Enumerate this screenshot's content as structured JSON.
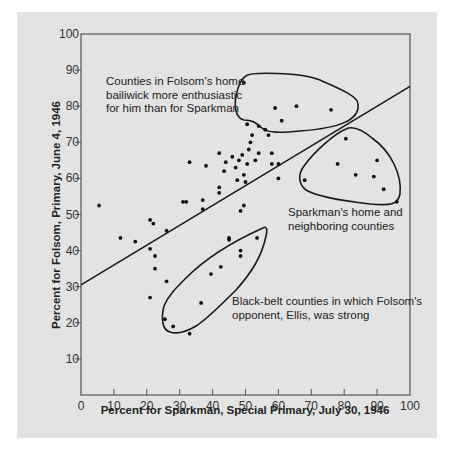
{
  "chart_data": {
    "type": "scatter",
    "title": "",
    "xlabel": "Percent for Sparkman, Special Primary, July 30, 1946",
    "ylabel": "Percent for Folsom, Primary, June 4, 1946",
    "xlim": [
      0,
      100
    ],
    "ylim": [
      0,
      100
    ],
    "xticks": [
      0,
      10,
      20,
      30,
      40,
      50,
      60,
      70,
      80,
      90,
      100
    ],
    "yticks": [
      10,
      20,
      30,
      40,
      50,
      60,
      70,
      80,
      90,
      100
    ],
    "grid": false,
    "regression_line": {
      "x": [
        0,
        100
      ],
      "y": [
        30.5,
        85.5
      ]
    },
    "annotations": [
      {
        "id": "folsom-home",
        "lines": [
          "Counties in Folsom's home",
          "bailiwick more enthusiastic",
          "for him than for Sparkman"
        ]
      },
      {
        "id": "sparkman-home",
        "lines": [
          "Sparkman's home and",
          "neighboring counties"
        ]
      },
      {
        "id": "black-belt",
        "lines": [
          "Black-belt counties in which Folsom's",
          "opponent, Ellis, was strong"
        ]
      }
    ],
    "points": [
      {
        "x": 5.5,
        "y": 52.5
      },
      {
        "x": 12,
        "y": 43.5
      },
      {
        "x": 16.5,
        "y": 42.5
      },
      {
        "x": 21,
        "y": 48.5
      },
      {
        "x": 22,
        "y": 47.5
      },
      {
        "x": 21,
        "y": 40.5
      },
      {
        "x": 22.5,
        "y": 38.5
      },
      {
        "x": 22.5,
        "y": 35
      },
      {
        "x": 26,
        "y": 45.5
      },
      {
        "x": 26,
        "y": 31.5
      },
      {
        "x": 21,
        "y": 27
      },
      {
        "x": 31,
        "y": 53.5
      },
      {
        "x": 32,
        "y": 53.5
      },
      {
        "x": 33,
        "y": 64.5
      },
      {
        "x": 37,
        "y": 54
      },
      {
        "x": 37,
        "y": 51.5
      },
      {
        "x": 38,
        "y": 63.5
      },
      {
        "x": 42,
        "y": 67
      },
      {
        "x": 42,
        "y": 57.5
      },
      {
        "x": 42,
        "y": 56
      },
      {
        "x": 44,
        "y": 64.5
      },
      {
        "x": 43.5,
        "y": 62
      },
      {
        "x": 45,
        "y": 43
      },
      {
        "x": 46,
        "y": 66
      },
      {
        "x": 47,
        "y": 63
      },
      {
        "x": 47.5,
        "y": 59.5
      },
      {
        "x": 48,
        "y": 65
      },
      {
        "x": 48.5,
        "y": 51
      },
      {
        "x": 49,
        "y": 66.5
      },
      {
        "x": 49.5,
        "y": 61
      },
      {
        "x": 49.5,
        "y": 52.5
      },
      {
        "x": 50,
        "y": 59
      },
      {
        "x": 50.5,
        "y": 64
      },
      {
        "x": 51,
        "y": 68
      },
      {
        "x": 51.5,
        "y": 70
      },
      {
        "x": 52,
        "y": 72
      },
      {
        "x": 53,
        "y": 65
      },
      {
        "x": 54,
        "y": 67
      },
      {
        "x": 56,
        "y": 73.5
      },
      {
        "x": 57,
        "y": 72
      },
      {
        "x": 58,
        "y": 67
      },
      {
        "x": 58,
        "y": 64
      },
      {
        "x": 60,
        "y": 64
      },
      {
        "x": 60,
        "y": 60
      },
      {
        "x": 49.5,
        "y": 86.5
      },
      {
        "x": 50.5,
        "y": 75
      },
      {
        "x": 54,
        "y": 74.5
      },
      {
        "x": 59,
        "y": 79.5
      },
      {
        "x": 61,
        "y": 76
      },
      {
        "x": 65.5,
        "y": 80
      },
      {
        "x": 76,
        "y": 79
      },
      {
        "x": 68,
        "y": 59.5
      },
      {
        "x": 78,
        "y": 64
      },
      {
        "x": 80.5,
        "y": 71
      },
      {
        "x": 83.5,
        "y": 61
      },
      {
        "x": 89,
        "y": 60.5
      },
      {
        "x": 90,
        "y": 65
      },
      {
        "x": 92,
        "y": 57
      },
      {
        "x": 96,
        "y": 53.5
      },
      {
        "x": 25.5,
        "y": 21
      },
      {
        "x": 28,
        "y": 19
      },
      {
        "x": 33,
        "y": 17
      },
      {
        "x": 36.5,
        "y": 25.5
      },
      {
        "x": 39.5,
        "y": 33.5
      },
      {
        "x": 42.5,
        "y": 35.5
      },
      {
        "x": 45,
        "y": 43.5
      },
      {
        "x": 48.5,
        "y": 38.5
      },
      {
        "x": 48.5,
        "y": 40
      },
      {
        "x": 53.5,
        "y": 43.5
      }
    ]
  }
}
